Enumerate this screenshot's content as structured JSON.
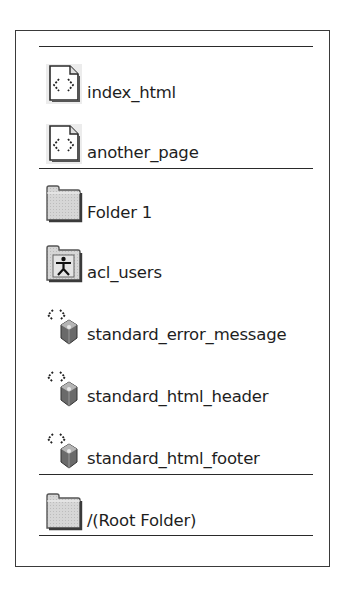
{
  "panel": {
    "groups": [
      {
        "items": [
          {
            "label": "index_html",
            "icon": "dtml-document-icon"
          },
          {
            "label": "another_page",
            "icon": "dtml-document-icon"
          }
        ]
      },
      {
        "items": [
          {
            "label": "Folder 1",
            "icon": "folder-icon"
          },
          {
            "label": "acl_users",
            "icon": "user-folder-icon"
          },
          {
            "label": "standard_error_message",
            "icon": "dtml-method-icon"
          },
          {
            "label": "standard_html_header",
            "icon": "dtml-method-icon"
          },
          {
            "label": "standard_html_footer",
            "icon": "dtml-method-icon"
          }
        ]
      },
      {
        "items": [
          {
            "label": "/(Root Folder)",
            "icon": "folder-icon"
          }
        ]
      }
    ]
  },
  "colors": {
    "border": "#3a3a3a",
    "icon_fill": "#d4d4d4",
    "icon_shadow": "#4a4a4a",
    "text": "#1e1e1e"
  }
}
